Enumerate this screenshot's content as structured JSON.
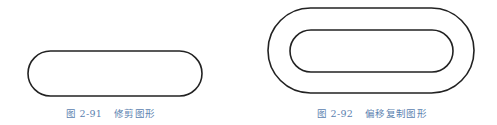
{
  "figures": [
    {
      "id": "2-91",
      "label": "图 2-91",
      "title": "修剪图形",
      "shape": {
        "type": "stadium",
        "x": 28,
        "y": 51,
        "width": 174,
        "height": 45
      }
    },
    {
      "id": "2-92",
      "label": "图 2-92",
      "title": "偏移复制图形",
      "shapes": [
        {
          "type": "stadium",
          "x": 268,
          "y": 8,
          "width": 206,
          "height": 85
        },
        {
          "type": "stadium",
          "x": 290,
          "y": 30,
          "width": 163,
          "height": 42
        }
      ]
    }
  ],
  "colors": {
    "stroke": "#222222",
    "caption": "#5b82b0"
  }
}
